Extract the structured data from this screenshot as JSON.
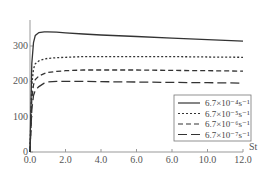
{
  "chart_data": {
    "type": "line",
    "title": "",
    "xlabel": "St",
    "ylabel": "",
    "xlim": [
      0,
      12
    ],
    "ylim": [
      0,
      380
    ],
    "x_ticks": [
      "0.0",
      "2.0",
      "4.0",
      "6.0",
      "6.0",
      "10.0",
      "12.0"
    ],
    "x_tick_values": [
      0,
      2,
      4,
      6,
      8,
      10,
      12
    ],
    "y_ticks": [
      "0",
      "100",
      "200",
      "300"
    ],
    "y_tick_values": [
      0,
      100,
      200,
      300
    ],
    "grid": false,
    "legend_position": "lower right",
    "x": [
      0,
      0.1,
      0.2,
      0.3,
      0.5,
      0.8,
      1.0,
      1.5,
      2.0,
      3.0,
      4.0,
      6.0,
      8.0,
      10.0,
      12.0
    ],
    "series": [
      {
        "name": "6.7×10⁻⁴s⁻¹",
        "style": "solid",
        "values": [
          0,
          250,
          310,
          330,
          338,
          340,
          340,
          339,
          337,
          334,
          331,
          327,
          322,
          318,
          314
        ]
      },
      {
        "name": "6.7×10⁻⁵s⁻¹",
        "style": "dotted",
        "values": [
          0,
          190,
          235,
          250,
          258,
          263,
          265,
          267,
          268,
          270,
          270,
          270,
          270,
          269,
          268
        ]
      },
      {
        "name": "6.7×10⁻⁶s⁻¹",
        "style": "dashed",
        "values": [
          0,
          150,
          190,
          205,
          215,
          222,
          225,
          228,
          230,
          232,
          232,
          232,
          231,
          230,
          229
        ]
      },
      {
        "name": "6.7×10⁻⁷s⁻¹",
        "style": "long-dashed",
        "values": [
          0,
          120,
          160,
          175,
          185,
          195,
          198,
          200,
          200,
          200,
          199,
          198,
          197,
          196,
          195
        ]
      }
    ]
  }
}
